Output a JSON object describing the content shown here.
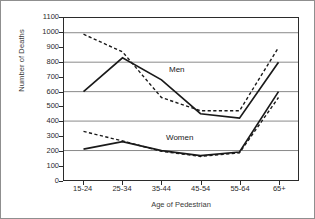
{
  "chart_data": {
    "type": "line",
    "title": "",
    "xlabel": "Age of Pedestrian",
    "ylabel": "Number of Deaths",
    "categories": [
      "15-24",
      "25-34",
      "35-44",
      "45-54",
      "55-64",
      "65+"
    ],
    "ylim": [
      0,
      1100
    ],
    "ytick_values": [
      0,
      100,
      200,
      300,
      400,
      500,
      600,
      700,
      800,
      900,
      1000,
      1100
    ],
    "ytick_labels": [
      "0",
      "100",
      "200",
      "300",
      "400",
      "500",
      "600",
      "700",
      "800",
      "900",
      "1000",
      "1100"
    ],
    "gridlines_at": [
      200,
      400,
      600,
      800,
      1000
    ],
    "grid": true,
    "legend": "none",
    "annotations": [
      {
        "text": "Men",
        "group": "men"
      },
      {
        "text": "Women",
        "group": "women"
      }
    ],
    "series": [
      {
        "name": "Men",
        "style": "solid",
        "group": "men",
        "values": [
          600,
          830,
          680,
          450,
          420,
          800
        ]
      },
      {
        "name": "Men",
        "style": "dashed",
        "group": "men",
        "values": [
          990,
          870,
          560,
          470,
          470,
          900
        ]
      },
      {
        "name": "Women",
        "style": "solid",
        "group": "women",
        "values": [
          210,
          260,
          200,
          165,
          190,
          600
        ]
      },
      {
        "name": "Women",
        "style": "dashed",
        "group": "women",
        "values": [
          330,
          265,
          195,
          160,
          185,
          560
        ]
      }
    ]
  },
  "axes": {
    "y_title": "Number of Deaths",
    "x_title": "Age of Pedestrian"
  },
  "labels": {
    "men": "Men",
    "women": "Women"
  },
  "colors": {
    "line": "#1a1a1a",
    "grid": "#8a8a8a",
    "axis": "#2b2b2b",
    "background": "#ffffff"
  }
}
